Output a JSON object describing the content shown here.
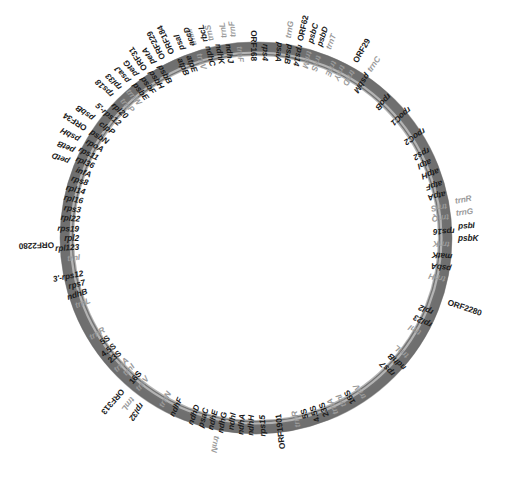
{
  "figure": {
    "type": "circular-genome-map",
    "title": "",
    "ring": {
      "center_x": 256,
      "center_y": 238,
      "outer_radius": 196,
      "inner_radius": 183,
      "fill_color": "#8d8d8d",
      "highlight_color": "#b9b9b9",
      "shadow_color": "#6e6e6e",
      "background_color": "#ffffff"
    },
    "label_colors": {
      "gene": "#1b1b1b",
      "trna": "#9a9a9a"
    }
  },
  "chart_data": {
    "type": "circular-map",
    "title": "",
    "xlabel": "",
    "ylabel": "",
    "legend": [],
    "grid": false,
    "features": [
      {
        "label": "trnM",
        "angle": -18.0,
        "side": "out",
        "kind": "trna"
      },
      {
        "label": "trnS",
        "angle": -13.0,
        "side": "out",
        "kind": "trna"
      },
      {
        "label": "trnL",
        "angle": -9.0,
        "side": "out",
        "kind": "trna"
      },
      {
        "label": "trnF",
        "angle": -6.6,
        "side": "out",
        "kind": "trna"
      },
      {
        "label": "trnG",
        "angle": 9.0,
        "side": "out",
        "kind": "trna"
      },
      {
        "label": "ORF62",
        "angle": 12.5,
        "side": "out",
        "kind": "orf"
      },
      {
        "label": "psbC",
        "angle": 15.6,
        "side": "out",
        "kind": "gene"
      },
      {
        "label": "psbD",
        "angle": 18.2,
        "side": "out",
        "kind": "gene"
      },
      {
        "label": "trnT",
        "angle": 20.8,
        "side": "out",
        "kind": "trna"
      },
      {
        "label": "ORF29",
        "angle": 29.5,
        "side": "out",
        "kind": "orf"
      },
      {
        "label": "trnC",
        "angle": 34.0,
        "side": "out",
        "kind": "trna"
      },
      {
        "label": "rpoB",
        "angle": 43.0,
        "side": "in",
        "kind": "gene"
      },
      {
        "label": "rpoC1",
        "angle": 50.0,
        "side": "in",
        "kind": "gene"
      },
      {
        "label": "rpoC2",
        "angle": 57.5,
        "side": "in",
        "kind": "gene"
      },
      {
        "label": "rps2",
        "angle": 63.0,
        "side": "in",
        "kind": "gene"
      },
      {
        "label": "atpI",
        "angle": 66.5,
        "side": "in",
        "kind": "gene"
      },
      {
        "label": "atpH",
        "angle": 70.0,
        "side": "in",
        "kind": "gene"
      },
      {
        "label": "atpF",
        "angle": 73.5,
        "side": "in",
        "kind": "gene"
      },
      {
        "label": "atpA",
        "angle": 77.0,
        "side": "in",
        "kind": "gene"
      },
      {
        "label": "trnR",
        "angle": 79.5,
        "side": "out",
        "kind": "trna"
      },
      {
        "label": "trnG",
        "angle": 83.0,
        "side": "out",
        "kind": "trna"
      },
      {
        "label": "psbI",
        "angle": 86.5,
        "side": "out",
        "kind": "gene"
      },
      {
        "label": "psbK",
        "angle": 90.0,
        "side": "out",
        "kind": "gene"
      },
      {
        "label": "trnS",
        "angle": 80.5,
        "side": "in",
        "kind": "trna"
      },
      {
        "label": "trnQ",
        "angle": 84.0,
        "side": "in",
        "kind": "trna"
      },
      {
        "label": "rps16",
        "angle": 88.0,
        "side": "in",
        "kind": "gene"
      },
      {
        "label": "trnK",
        "angle": 92.0,
        "side": "in",
        "kind": "trna"
      },
      {
        "label": "matK",
        "angle": 95.5,
        "side": "in",
        "kind": "gene"
      },
      {
        "label": "psbA",
        "angle": 99.0,
        "side": "in",
        "kind": "gene"
      },
      {
        "label": "trnH",
        "angle": 102.5,
        "side": "in",
        "kind": "trna"
      },
      {
        "label": "ORF2280",
        "angle": 108.5,
        "side": "out",
        "kind": "orf"
      },
      {
        "label": "rpl2",
        "angle": 113.0,
        "side": "in",
        "kind": "gene"
      },
      {
        "label": "rpl23",
        "angle": 116.5,
        "side": "in",
        "kind": "gene"
      },
      {
        "label": "trnI",
        "angle": 120.0,
        "side": "in",
        "kind": "trna"
      },
      {
        "label": "trnL",
        "angle": 128.0,
        "side": "in",
        "kind": "trna"
      },
      {
        "label": "ndhB",
        "angle": 131.5,
        "side": "in",
        "kind": "gene"
      },
      {
        "label": "rps7",
        "angle": 135.0,
        "side": "in",
        "kind": "gene"
      },
      {
        "label": "trnV",
        "angle": 146.0,
        "side": "in",
        "kind": "trna"
      },
      {
        "label": "16S",
        "angle": 149.5,
        "side": "in",
        "kind": "rrna"
      },
      {
        "label": "trnI",
        "angle": 152.5,
        "side": "in",
        "kind": "trna"
      },
      {
        "label": "trnA",
        "angle": 155.5,
        "side": "in",
        "kind": "trna"
      },
      {
        "label": "23S",
        "angle": 158.5,
        "side": "in",
        "kind": "rrna"
      },
      {
        "label": "4.5S",
        "angle": 161.5,
        "side": "in",
        "kind": "rrna"
      },
      {
        "label": "5S",
        "angle": 164.5,
        "side": "in",
        "kind": "rrna"
      },
      {
        "label": "trnR",
        "angle": 167.5,
        "side": "in",
        "kind": "trna"
      },
      {
        "label": "ORF1901",
        "angle": 173.0,
        "side": "in",
        "kind": "orf"
      },
      {
        "label": "rps15",
        "angle": 178.0,
        "side": "in",
        "kind": "gene"
      },
      {
        "label": "ndhH",
        "angle": 181.5,
        "side": "in",
        "kind": "gene"
      },
      {
        "label": "ndhA",
        "angle": 184.5,
        "side": "in",
        "kind": "gene"
      },
      {
        "label": "ndhI",
        "angle": 187.5,
        "side": "in",
        "kind": "gene"
      },
      {
        "label": "ndhG",
        "angle": 190.5,
        "side": "in",
        "kind": "gene"
      },
      {
        "label": "ndhE",
        "angle": 193.5,
        "side": "in",
        "kind": "gene"
      },
      {
        "label": "psaC",
        "angle": 196.5,
        "side": "in",
        "kind": "gene"
      },
      {
        "label": "ndhD",
        "angle": 199.5,
        "side": "in",
        "kind": "gene"
      },
      {
        "label": "ndhF",
        "angle": 205.5,
        "side": "in",
        "kind": "gene"
      },
      {
        "label": "trnN",
        "angle": 209.5,
        "side": "in",
        "kind": "trna"
      },
      {
        "label": "trnN",
        "angle": 191.0,
        "side": "out",
        "kind": "trna"
      },
      {
        "label": "rpl32",
        "angle": 214.5,
        "side": "out",
        "kind": "gene"
      },
      {
        "label": "trnL",
        "angle": 217.5,
        "side": "out",
        "kind": "trna"
      },
      {
        "label": "ORF313",
        "angle": 221.0,
        "side": "out",
        "kind": "orf"
      },
      {
        "label": "trnV",
        "angle": 218.0,
        "side": "in",
        "kind": "trna"
      },
      {
        "label": "16S",
        "angle": 221.0,
        "side": "in",
        "kind": "rrna"
      },
      {
        "label": "trnI",
        "angle": 224.0,
        "side": "in",
        "kind": "trna"
      },
      {
        "label": "trnA",
        "angle": 227.0,
        "side": "in",
        "kind": "trna"
      },
      {
        "label": "23S",
        "angle": 230.0,
        "side": "in",
        "kind": "rrna"
      },
      {
        "label": "4.5S",
        "angle": 233.0,
        "side": "in",
        "kind": "rrna"
      },
      {
        "label": "5S",
        "angle": 236.0,
        "side": "in",
        "kind": "rrna"
      },
      {
        "label": "trnR",
        "angle": 239.0,
        "side": "in",
        "kind": "trna"
      },
      {
        "label": "trnL",
        "angle": 249.5,
        "side": "in",
        "kind": "trna"
      },
      {
        "label": "ndhB",
        "angle": 252.5,
        "side": "in",
        "kind": "gene"
      },
      {
        "label": "rps7",
        "angle": 255.5,
        "side": "in",
        "kind": "gene"
      },
      {
        "label": "3'-rps12",
        "angle": 258.5,
        "side": "in",
        "kind": "gene"
      },
      {
        "label": "ORF2280",
        "angle": 268.0,
        "side": "out",
        "kind": "orf"
      },
      {
        "label": "trnI",
        "angle": 264.0,
        "side": "in",
        "kind": "trna"
      },
      {
        "label": "rpl123",
        "angle": 267.0,
        "side": "in",
        "kind": "gene"
      },
      {
        "label": "rpl2",
        "angle": 270.0,
        "side": "in",
        "kind": "gene"
      },
      {
        "label": "rps19",
        "angle": 273.0,
        "side": "in",
        "kind": "gene"
      },
      {
        "label": "rpl22",
        "angle": 276.0,
        "side": "in",
        "kind": "gene"
      },
      {
        "label": "rps3",
        "angle": 279.0,
        "side": "in",
        "kind": "gene"
      },
      {
        "label": "rpl16",
        "angle": 282.0,
        "side": "in",
        "kind": "gene"
      },
      {
        "label": "rpl14",
        "angle": 285.0,
        "side": "in",
        "kind": "gene"
      },
      {
        "label": "rps8",
        "angle": 288.0,
        "side": "in",
        "kind": "gene"
      },
      {
        "label": "infA",
        "angle": 291.0,
        "side": "in",
        "kind": "gene"
      },
      {
        "label": "rpl36",
        "angle": 294.0,
        "side": "in",
        "kind": "gene"
      },
      {
        "label": "rps11",
        "angle": 297.0,
        "side": "in",
        "kind": "gene"
      },
      {
        "label": "rpoA",
        "angle": 300.0,
        "side": "in",
        "kind": "gene"
      },
      {
        "label": "psbN",
        "angle": 303.0,
        "side": "in",
        "kind": "gene"
      },
      {
        "label": "clpP",
        "angle": 306.5,
        "side": "in",
        "kind": "gene"
      },
      {
        "label": "5'-rps12",
        "angle": 310.0,
        "side": "in",
        "kind": "gene"
      },
      {
        "label": "rpl20",
        "angle": 313.0,
        "side": "in",
        "kind": "gene"
      },
      {
        "label": "trnP",
        "angle": 316.0,
        "side": "in",
        "kind": "trna"
      },
      {
        "label": "trnW",
        "angle": 319.0,
        "side": "in",
        "kind": "trna"
      },
      {
        "label": "psbE",
        "angle": 322.0,
        "side": "in",
        "kind": "gene"
      },
      {
        "label": "psbF",
        "angle": 325.0,
        "side": "in",
        "kind": "gene"
      },
      {
        "label": "psbH",
        "angle": 328.0,
        "side": "in",
        "kind": "gene"
      },
      {
        "label": "psbB",
        "angle": 331.0,
        "side": "in",
        "kind": "gene"
      },
      {
        "label": "petD",
        "angle": 292.0,
        "side": "out",
        "kind": "gene"
      },
      {
        "label": "petB",
        "angle": 295.5,
        "side": "out",
        "kind": "gene"
      },
      {
        "label": "psbH",
        "angle": 299.0,
        "side": "out",
        "kind": "gene"
      },
      {
        "label": "ORF34",
        "angle": 302.5,
        "side": "out",
        "kind": "orf"
      },
      {
        "label": "psbB",
        "angle": 306.0,
        "side": "out",
        "kind": "gene"
      },
      {
        "label": "rps18",
        "angle": 314.5,
        "side": "out",
        "kind": "gene"
      },
      {
        "label": "rpl33",
        "angle": 317.5,
        "side": "out",
        "kind": "gene"
      },
      {
        "label": "psaJ",
        "angle": 320.5,
        "side": "out",
        "kind": "gene"
      },
      {
        "label": "petG",
        "angle": 323.5,
        "side": "out",
        "kind": "gene"
      },
      {
        "label": "ORF31",
        "angle": 326.5,
        "side": "out",
        "kind": "orf"
      },
      {
        "label": "petA",
        "angle": 329.5,
        "side": "out",
        "kind": "gene"
      },
      {
        "label": "ORF229",
        "angle": 332.5,
        "side": "out",
        "kind": "orf"
      },
      {
        "label": "ORF184",
        "angle": 335.5,
        "side": "out",
        "kind": "orf"
      },
      {
        "label": "psaI",
        "angle": 338.5,
        "side": "out",
        "kind": "gene"
      },
      {
        "label": "accD",
        "angle": 341.5,
        "side": "out",
        "kind": "gene"
      },
      {
        "label": "rbcL",
        "angle": 345.5,
        "side": "out",
        "kind": "gene"
      },
      {
        "label": "atpB",
        "angle": 337.0,
        "side": "in",
        "kind": "gene"
      },
      {
        "label": "atpE",
        "angle": 340.0,
        "side": "in",
        "kind": "gene"
      },
      {
        "label": "trnV",
        "angle": 343.0,
        "side": "in",
        "kind": "trna"
      },
      {
        "label": "ndhC",
        "angle": 346.0,
        "side": "in",
        "kind": "gene"
      },
      {
        "label": "ndhK",
        "angle": 349.0,
        "side": "in",
        "kind": "gene"
      },
      {
        "label": "ndhJ",
        "angle": 352.0,
        "side": "in",
        "kind": "gene"
      },
      {
        "label": "trnF",
        "angle": 355.0,
        "side": "in",
        "kind": "trna"
      },
      {
        "label": "ORF168",
        "angle": 359.5,
        "side": "in",
        "kind": "orf"
      },
      {
        "label": "rps4",
        "angle": 3.0,
        "side": "in",
        "kind": "gene"
      },
      {
        "label": "psaA",
        "angle": 7.0,
        "side": "in",
        "kind": "gene"
      },
      {
        "label": "psaB",
        "angle": 10.0,
        "side": "in",
        "kind": "gene"
      },
      {
        "label": "rps14",
        "angle": 13.0,
        "side": "in",
        "kind": "gene"
      },
      {
        "label": "trnM",
        "angle": 16.0,
        "side": "in",
        "kind": "trna"
      },
      {
        "label": "trnS",
        "angle": 19.0,
        "side": "in",
        "kind": "trna"
      },
      {
        "label": "trnE",
        "angle": 24.0,
        "side": "in",
        "kind": "trna"
      },
      {
        "label": "trnY",
        "angle": 27.0,
        "side": "in",
        "kind": "trna"
      },
      {
        "label": "trnD",
        "angle": 30.0,
        "side": "in",
        "kind": "trna"
      },
      {
        "label": "psbM",
        "angle": 34.5,
        "side": "in",
        "kind": "gene"
      }
    ]
  }
}
